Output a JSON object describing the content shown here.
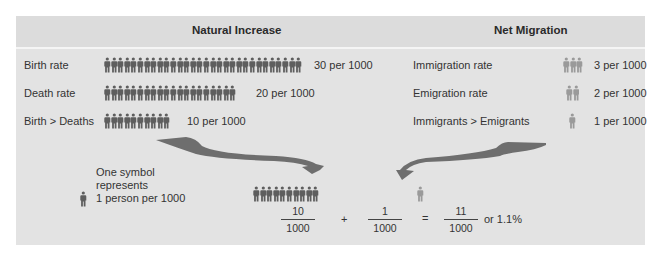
{
  "headers": {
    "natural_increase": "Natural Increase",
    "net_migration": "Net Migration"
  },
  "natural_rows": [
    {
      "label": "Birth rate",
      "count": 30,
      "value": "30 per 1000"
    },
    {
      "label": "Death rate",
      "count": 20,
      "value": "20 per 1000"
    },
    {
      "label": "Birth > Deaths",
      "count": 10,
      "value": "10 per 1000"
    }
  ],
  "migration_rows": [
    {
      "label": "Immigration rate",
      "count": 3,
      "value": "3 per 1000"
    },
    {
      "label": "Emigration rate",
      "count": 2,
      "value": "2 per 1000"
    },
    {
      "label": "Immigrants > Emigrants",
      "count": 1,
      "value": "1 per 1000"
    }
  ],
  "legend": {
    "line1": "One symbol",
    "line2": "represents",
    "line3": "1 person per 1000"
  },
  "equation": {
    "natural_count": 10,
    "migration_count": 1,
    "frac1_num": "10",
    "frac1_den": "1000",
    "plus": "+",
    "frac2_num": "1",
    "frac2_den": "1000",
    "equals": "=",
    "result_num": "11",
    "result_den": "1000",
    "percent": "or 1.1%"
  },
  "colors": {
    "panel_bg": "#e3e3e3",
    "natural_figure": "#5e5e5e",
    "migration_figure": "#9a9a9a",
    "arrow": "#6e6e6e"
  }
}
